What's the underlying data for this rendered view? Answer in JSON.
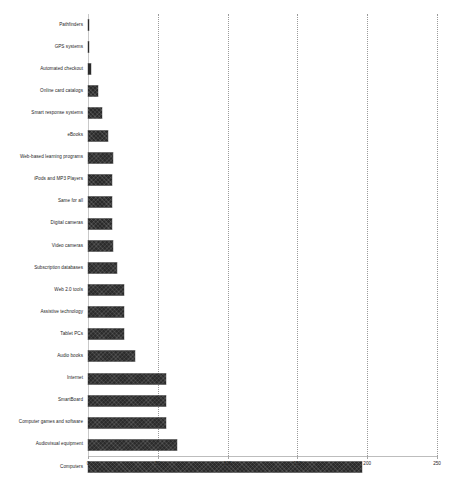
{
  "chart_data": {
    "type": "bar",
    "orientation": "horizontal",
    "title": "",
    "subtitle": "",
    "xlabel": "",
    "ylabel": "",
    "xlim": [
      0,
      250
    ],
    "ylim": null,
    "grid": true,
    "grid_axis": "x",
    "legend": false,
    "legend_position": "none",
    "xticks": [
      0,
      50,
      100,
      150,
      200,
      250
    ],
    "xtick_labels": [
      "0",
      "50",
      "100",
      "150",
      "200",
      "250"
    ],
    "bar_color": "#2b2b2b",
    "categories": [
      "Pathfinders",
      "GPS systems",
      "Automated checkout",
      "Online card catalogs",
      "Smart response systems",
      "eBooks",
      "Web-based learning programs",
      "iPods and MP3 Players",
      "Same for all",
      "Digital cameras",
      "Video cameras",
      "Subscription databases",
      "Web 2.0 tools",
      "Assistive technology",
      "Tablet PCs",
      "Audio books",
      "Internet",
      "SmartBoard",
      "Computer games and software",
      "Audiovisual equipment",
      "Computers"
    ],
    "values": [
      1,
      1,
      2,
      7,
      10,
      14,
      18,
      17,
      17,
      17,
      18,
      21,
      26,
      26,
      26,
      34,
      56,
      56,
      56,
      64,
      196
    ]
  }
}
